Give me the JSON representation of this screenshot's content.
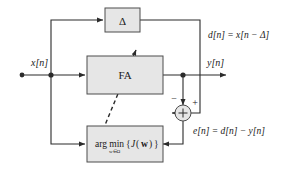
{
  "diagram": {
    "blocks": [
      {
        "id": "delay",
        "label": "Δ",
        "name": "delay-block"
      },
      {
        "id": "fa",
        "label": "FA",
        "name": "fa-block"
      },
      {
        "id": "argmin",
        "label_arg": "arg min",
        "label_sub": "w∈Ω",
        "label_brace_open": "{",
        "label_J": "J",
        "label_paren_open": "(",
        "label_w": "w",
        "label_paren_close": ")",
        "label_brace_close": "}",
        "name": "argmin-block"
      }
    ],
    "signals": {
      "input": "x[n]",
      "output": "y[n]",
      "desired_equation": "d[n] = x[n − Δ]",
      "error_equation": "e[n] = d[n] − y[n]"
    },
    "summing_junction": {
      "minus_sign": "−",
      "plus_sign": "+",
      "name": "summing-junction"
    },
    "colors": {
      "block_fill": "#e6e6e6",
      "block_stroke": "#4d4d4d",
      "wire": "#2b2b2b",
      "text": "#1a1a1a",
      "background": "#ffffff"
    }
  }
}
